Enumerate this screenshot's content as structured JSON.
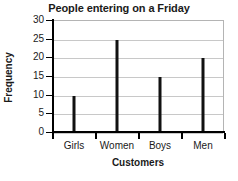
{
  "chart_data": {
    "type": "bar",
    "title": "People entering on a Friday",
    "xlabel": "Customers",
    "ylabel": "Frequency",
    "categories": [
      "Girls",
      "Women",
      "Boys",
      "Men"
    ],
    "values": [
      10,
      25,
      15,
      20
    ],
    "ylim": [
      0,
      30
    ],
    "yticks": [
      0,
      5,
      10,
      15,
      20,
      25,
      30
    ],
    "ytick_labels": [
      "0",
      "5",
      "10",
      "15",
      "20",
      "25",
      "30"
    ],
    "grid": true,
    "legend": false,
    "bar_color": "#111111",
    "grid_color": "#c8c8c8",
    "axis_color": "#000000",
    "background": "#ffffff"
  }
}
